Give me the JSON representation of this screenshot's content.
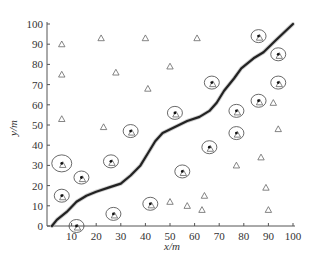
{
  "chart_data": {
    "type": "scatter",
    "title": "",
    "xlabel": "x/m",
    "ylabel": "y/m",
    "xlim": [
      0,
      100
    ],
    "ylim": [
      0,
      100
    ],
    "xticks": [
      10,
      20,
      30,
      40,
      50,
      60,
      70,
      80,
      90,
      100
    ],
    "yticks": [
      0,
      10,
      20,
      30,
      40,
      50,
      60,
      70,
      80,
      90,
      100
    ],
    "grid": false,
    "legend": null,
    "series": [
      {
        "name": "nodes (triangles)",
        "marker": "triangle",
        "points": [
          [
            6,
            90
          ],
          [
            22,
            93
          ],
          [
            40,
            93
          ],
          [
            61,
            93
          ],
          [
            6,
            75
          ],
          [
            28,
            76
          ],
          [
            41,
            68
          ],
          [
            50,
            79
          ],
          [
            6,
            53
          ],
          [
            23,
            49
          ],
          [
            57,
            10
          ],
          [
            64,
            15
          ],
          [
            63,
            8
          ],
          [
            77,
            30
          ],
          [
            87,
            34
          ],
          [
            89,
            19
          ],
          [
            90,
            8
          ],
          [
            92,
            61
          ],
          [
            94,
            48
          ],
          [
            50,
            12
          ]
        ]
      },
      {
        "name": "covered nodes (circled)",
        "marker": "circle-dot",
        "points": [
          [
            6,
            31
          ],
          [
            6,
            15
          ],
          [
            14,
            24
          ],
          [
            26,
            32
          ],
          [
            34,
            47
          ],
          [
            27,
            6
          ],
          [
            42,
            11
          ],
          [
            55,
            27
          ],
          [
            52,
            56
          ],
          [
            66,
            39
          ],
          [
            67,
            71
          ],
          [
            77,
            57
          ],
          [
            77,
            46
          ],
          [
            86,
            62
          ],
          [
            86,
            94
          ],
          [
            94,
            85
          ],
          [
            94,
            71
          ],
          [
            12,
            0
          ]
        ]
      },
      {
        "name": "trajectory",
        "marker": "line",
        "points": [
          [
            2,
            0
          ],
          [
            4,
            3
          ],
          [
            8,
            7
          ],
          [
            12,
            12
          ],
          [
            16,
            15
          ],
          [
            20,
            17
          ],
          [
            25,
            19
          ],
          [
            30,
            21
          ],
          [
            34,
            25
          ],
          [
            38,
            30
          ],
          [
            41,
            36
          ],
          [
            44,
            42
          ],
          [
            47,
            46
          ],
          [
            52,
            49
          ],
          [
            57,
            52
          ],
          [
            62,
            54
          ],
          [
            66,
            57
          ],
          [
            69,
            61
          ],
          [
            72,
            67
          ],
          [
            76,
            73
          ],
          [
            79,
            78
          ],
          [
            84,
            83
          ],
          [
            88,
            86
          ],
          [
            93,
            92
          ],
          [
            100,
            100
          ]
        ]
      }
    ]
  }
}
